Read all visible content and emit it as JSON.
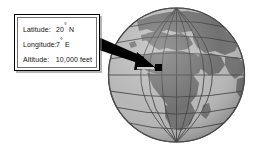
{
  "scene": {
    "background_color": "#ffffff",
    "width": 257,
    "height": 148
  },
  "callout": {
    "border_color": "#000000",
    "background_color": "#ffffff",
    "rows": [
      {
        "label": "Latitude:",
        "value": "20",
        "degree": "°",
        "suffix": " N"
      },
      {
        "label": "Longitude:",
        "value": "7",
        "degree": "°",
        "suffix": " E"
      },
      {
        "label": "Altitude:",
        "value": "10,000",
        "degree": "",
        "suffix": " feet"
      }
    ]
  },
  "arrow": {
    "name": "pointer-arrow",
    "color": "#000000",
    "points_to": "location-marker"
  },
  "marker": {
    "name": "location-marker",
    "color": "#000000"
  },
  "globe": {
    "ocean_color": "#b4b4b4",
    "land_color": "#6b6b6b",
    "grid_color": "#3c3c3c",
    "outline_color": "#4a4a4a",
    "shadow_color": "#8e8e8e",
    "highlight_color": "#c8c8c8",
    "description": "Earth globe centered on Africa, Europe and western Asia with latitude and longitude gridlines"
  }
}
